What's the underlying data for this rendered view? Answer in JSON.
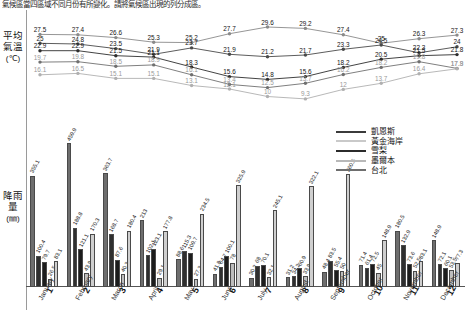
{
  "caption": "氣候區當四區域不同月份有所變化。請將氣候區出現的列分成區。",
  "axis": {
    "y_temp_label": "平均氣溫",
    "y_temp_unit": "(℃)",
    "y_rain_label": "降雨量",
    "y_rain_unit": "(㎜)"
  },
  "legend": {
    "title": "",
    "items": [
      {
        "label": "凱恩斯",
        "color": "#3b3b3b"
      },
      {
        "label": "黃金海岸",
        "color": "#c9c9c9"
      },
      {
        "label": "雪梨",
        "color": "#2b2b2b"
      },
      {
        "label": "墨爾本",
        "color": "#b8b8b8"
      },
      {
        "label": "台北",
        "color": "#6e6e6e"
      }
    ]
  },
  "chart_data": {
    "type": "bar",
    "title": "",
    "xlabel": "",
    "ylabel": "降雨量 (㎜) / 平均氣溫 (℃)",
    "categories": [
      "1",
      "2",
      "3",
      "4",
      "5",
      "6",
      "7",
      "8",
      "9",
      "10",
      "11",
      "12"
    ],
    "category_names": [
      "January",
      "February",
      "March",
      "April",
      "May",
      "June",
      "July",
      "August",
      "September",
      "October",
      "November",
      "December"
    ],
    "month_numbers": [
      "1",
      "2",
      "3",
      "4",
      "5",
      "6",
      "7",
      "8",
      "9",
      "10",
      "11",
      "12"
    ],
    "temperature": {
      "type": "line",
      "unit": "℃",
      "ylim": [
        9,
        31
      ],
      "series": [
        {
          "name": "凱恩斯",
          "color": "#8a8a8a",
          "values": [
            27.5,
            27.4,
            26.6,
            25.3,
            25.2,
            27.7,
            29.6,
            29.2,
            27.4,
            25.0,
            26.3,
            27.3
          ]
        },
        {
          "name": "黃金海岸",
          "color": "#4a4a4a",
          "values": [
            25.0,
            24.8,
            23.5,
            21.9,
            23.7,
            21.9,
            21.2,
            21.7,
            23.3,
            24.5,
            22.3,
            24.0
          ]
        },
        {
          "name": "雪梨",
          "color": "#2e2e2e",
          "values": [
            22.9,
            22.9,
            21.5,
            21.1,
            18.3,
            15.6,
            14.8,
            15.6,
            18.2,
            20.5,
            21.5,
            21.8
          ]
        },
        {
          "name": "墨爾本",
          "color": "#707070",
          "values": [
            19.7,
            19.8,
            18.5,
            18.9,
            16.1,
            13.4,
            12.5,
            13.7,
            16.2,
            18.2,
            19.8,
            17.9
          ]
        },
        {
          "name": "台北",
          "color": "#b0b0b0",
          "values": [
            16.1,
            16.5,
            15.1,
            15.1,
            13.1,
            12.1,
            10.0,
            9.3,
            12.0,
            13.7,
            16.4,
            17.8
          ]
        }
      ]
    },
    "rainfall": {
      "type": "bar",
      "unit": "㎜",
      "ylim": [
        0,
        470
      ],
      "series": [
        {
          "name": "凱恩斯",
          "color": "#6e6e6e",
          "values": [
            355.1,
            459.9,
            363.7,
            213.0,
            88.6,
            41.8,
            30.2,
            31.2,
            48.4,
            71.4,
            180.5,
            148.9
          ]
        },
        {
          "name": "黃金海岸",
          "color": "#2f2f2f",
          "values": [
            100.4,
            188.8,
            168.7,
            102.1,
            115.3,
            64.7,
            68.0,
            34.2,
            83.5,
            61.4,
            132.9,
            72.1
          ]
        },
        {
          "name": "雪梨",
          "color": "#1c1c1c",
          "values": [
            79.7,
            121.1,
            87.6,
            123.1,
            109.7,
            100.1,
            70.1,
            60.9,
            55.4,
            72.5,
            73.6,
            60.1
          ]
        },
        {
          "name": "墨爾本",
          "color": "#bdbdbd",
          "values": [
            26.5,
            43.9,
            40.3,
            29.1,
            27.3,
            78.0,
            32.1,
            33.9,
            50.0,
            45.0,
            52.5,
            53.5
          ]
        },
        {
          "name": "台北",
          "color": "#cfcfcf",
          "values": [
            83.1,
            170.3,
            180.4,
            177.8,
            234.5,
            325.9,
            245.1,
            322.1,
            360.5,
            148.9,
            83.1,
            77.3
          ]
        }
      ]
    }
  }
}
